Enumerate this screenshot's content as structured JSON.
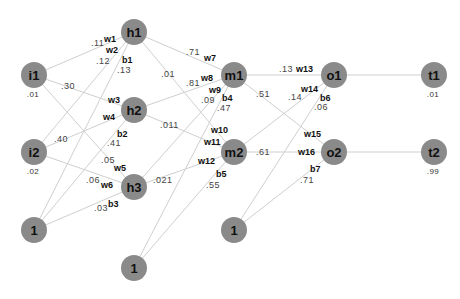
{
  "diagram": {
    "title": "",
    "colors": {
      "node_fill": "#8a8a8a",
      "edge": "#cfcfcf",
      "label": "#111111",
      "value": "#444444"
    },
    "nodes": {
      "i1": {
        "label": "i1",
        "value": ".01"
      },
      "i2": {
        "label": "i2",
        "value": ".02"
      },
      "bias1": {
        "label": "1"
      },
      "h1": {
        "label": "h1"
      },
      "h2": {
        "label": "h2"
      },
      "h3": {
        "label": "h3"
      },
      "bias2": {
        "label": "1"
      },
      "m1": {
        "label": "m1"
      },
      "m2": {
        "label": "m2"
      },
      "bias3": {
        "label": "1"
      },
      "o1": {
        "label": "o1"
      },
      "o2": {
        "label": "o2"
      },
      "t1": {
        "label": "t1",
        "value": ".01"
      },
      "t2": {
        "label": "t2",
        "value": ".99"
      }
    },
    "weights": {
      "w1": {
        "name": "w1",
        "value": ".11"
      },
      "w2": {
        "name": "w2",
        "value": ".12"
      },
      "b1": {
        "name": "b1",
        "value": ".13"
      },
      "w3": {
        "name": "w3",
        "value": ".30"
      },
      "w4": {
        "name": "w4",
        "value": ".40"
      },
      "b2": {
        "name": "b2",
        "value": ".41"
      },
      "w5": {
        "name": "w5",
        "value": ".05"
      },
      "w6": {
        "name": "w6",
        "value": ".06"
      },
      "b3": {
        "name": "b3",
        "value": ".03"
      },
      "w7": {
        "name": "w7",
        "value": ".71"
      },
      "w8": {
        "name": "w8",
        "value": ".81"
      },
      "w9": {
        "name": "w9",
        "value": ".09"
      },
      "b4": {
        "name": "b4",
        "value": ".47"
      },
      "w10": {
        "name": "w10",
        "value": ".01"
      },
      "w11": {
        "name": "w11",
        "value": ".011"
      },
      "w12": {
        "name": "w12",
        "value": ".021"
      },
      "b5": {
        "name": "b5",
        "value": ".55"
      },
      "w13": {
        "name": "w13",
        "value": ".13"
      },
      "w14": {
        "name": "w14",
        "value": ".14"
      },
      "b6": {
        "name": "b6",
        "value": ".06"
      },
      "w15": {
        "name": "w15",
        "value": ".51"
      },
      "w16": {
        "name": "w16",
        "value": ".61"
      },
      "b7": {
        "name": "b7",
        "value": ".71"
      }
    }
  }
}
